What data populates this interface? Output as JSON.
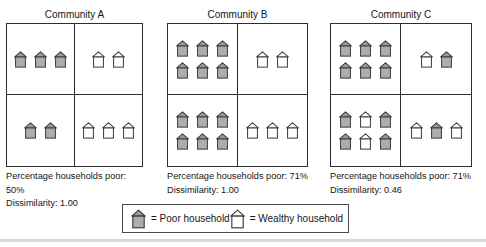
{
  "figure": {
    "communities": [
      {
        "title": "Community A",
        "quadrants": {
          "top_left": [
            "PPP"
          ],
          "top_right": [
            "WW"
          ],
          "bottom_left": [
            "PP"
          ],
          "bottom_right": [
            "WWW"
          ]
        },
        "poor_line": "Percentage households poor: 50%",
        "dissimilarity_line": "Dissimilarity: 1.00"
      },
      {
        "title": "Community B",
        "quadrants": {
          "top_left": [
            "PPP",
            "PPP"
          ],
          "top_right": [
            "WW"
          ],
          "bottom_left": [
            "PPP",
            "PPP"
          ],
          "bottom_right": [
            "WWW"
          ]
        },
        "poor_line": "Percentage households poor: 71%",
        "dissimilarity_line": "Dissimilarity: 1.00"
      },
      {
        "title": "Community C",
        "quadrants": {
          "top_left": [
            "PPP",
            "PPP"
          ],
          "top_right": [
            "WP"
          ],
          "bottom_left": [
            "PWP",
            "PWP"
          ],
          "bottom_right": [
            "WPW"
          ]
        },
        "poor_line": "Percentage households poor: 71%",
        "dissimilarity_line": "Dissimilarity: 0.46"
      }
    ],
    "legend": {
      "poor_icon": [
        "P"
      ],
      "wealthy_icon": [
        "W"
      ],
      "poor_label": "= Poor household",
      "wealthy_label": "= Wealthy household"
    },
    "colors": {
      "outline": "#3d3d3d",
      "poor_roof": "#9a9a9a",
      "poor_body": "#adadad",
      "wealthy_fill": "#ffffff"
    }
  }
}
